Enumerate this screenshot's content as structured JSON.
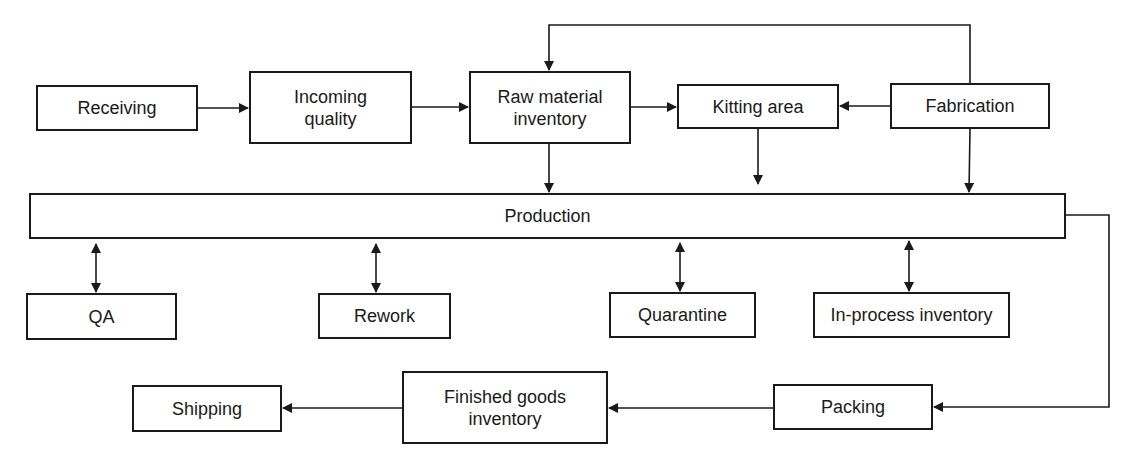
{
  "diagram": {
    "nodes": {
      "receiving": {
        "label": "Receiving"
      },
      "incoming_quality": {
        "label": "Incoming\nquality"
      },
      "raw_material": {
        "label": "Raw material\ninventory"
      },
      "kitting": {
        "label": "Kitting area"
      },
      "fabrication": {
        "label": "Fabrication"
      },
      "production": {
        "label": "Production"
      },
      "qa": {
        "label": "QA"
      },
      "rework": {
        "label": "Rework"
      },
      "quarantine": {
        "label": "Quarantine"
      },
      "in_process": {
        "label": "In-process inventory"
      },
      "shipping": {
        "label": "Shipping"
      },
      "finished_goods": {
        "label": "Finished goods\ninventory"
      },
      "packing": {
        "label": "Packing"
      }
    },
    "edges": [
      {
        "from": "Receiving",
        "to": "Incoming quality",
        "type": "arrow"
      },
      {
        "from": "Incoming quality",
        "to": "Raw material inventory",
        "type": "arrow"
      },
      {
        "from": "Raw material inventory",
        "to": "Kitting area",
        "type": "arrow"
      },
      {
        "from": "Fabrication",
        "to": "Kitting area",
        "type": "arrow"
      },
      {
        "from": "Fabrication",
        "to": "Raw material inventory",
        "type": "arrow",
        "route": "over top"
      },
      {
        "from": "Raw material inventory",
        "to": "Production",
        "type": "arrow"
      },
      {
        "from": "Kitting area",
        "to": "Production",
        "type": "arrow"
      },
      {
        "from": "Fabrication",
        "to": "Production",
        "type": "arrow"
      },
      {
        "from": "Production",
        "to": "QA",
        "type": "bidirectional"
      },
      {
        "from": "Production",
        "to": "Rework",
        "type": "bidirectional"
      },
      {
        "from": "Production",
        "to": "Quarantine",
        "type": "bidirectional"
      },
      {
        "from": "Production",
        "to": "In-process inventory",
        "type": "bidirectional"
      },
      {
        "from": "Production",
        "to": "Packing",
        "type": "arrow",
        "route": "right side"
      },
      {
        "from": "Packing",
        "to": "Finished goods inventory",
        "type": "arrow"
      },
      {
        "from": "Finished goods inventory",
        "to": "Shipping",
        "type": "arrow"
      }
    ],
    "colors": {
      "stroke": "#1a1a1a",
      "background": "#ffffff"
    }
  }
}
